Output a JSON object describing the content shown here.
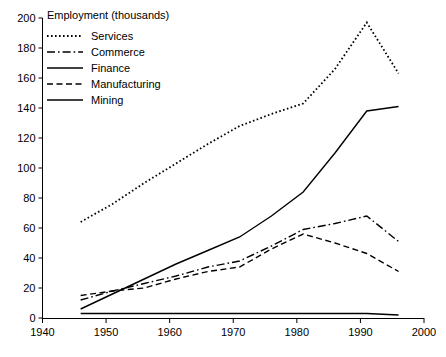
{
  "chart_data": {
    "type": "line",
    "title": "",
    "xlabel": "",
    "ylabel": "Employment (thousands)",
    "xlim": [
      1940,
      2000
    ],
    "ylim": [
      0,
      200
    ],
    "xticks": [
      1940,
      1950,
      1960,
      1970,
      1980,
      1990,
      2000
    ],
    "yticks": [
      0,
      20,
      40,
      60,
      80,
      100,
      120,
      140,
      160,
      180,
      200
    ],
    "grid": false,
    "legend_position": "top-left",
    "series": [
      {
        "name": "Services",
        "style": "dotted",
        "x": [
          1946,
          1951,
          1956,
          1961,
          1966,
          1971,
          1976,
          1981,
          1986,
          1991,
          1996
        ],
        "values": [
          64,
          76,
          90,
          103,
          116,
          128,
          136,
          143,
          166,
          197,
          163
        ]
      },
      {
        "name": "Commerce",
        "style": "dash-dot",
        "x": [
          1946,
          1951,
          1956,
          1961,
          1966,
          1971,
          1976,
          1981,
          1986,
          1991,
          1996
        ],
        "values": [
          12,
          18,
          23,
          28,
          34,
          38,
          48,
          59,
          63,
          68,
          51
        ]
      },
      {
        "name": "Finance",
        "style": "solid",
        "x": [
          1946,
          1951,
          1956,
          1961,
          1966,
          1971,
          1976,
          1981,
          1986,
          1991,
          1996
        ],
        "values": [
          6,
          16,
          26,
          36,
          45,
          54,
          68,
          84,
          110,
          138,
          141
        ]
      },
      {
        "name": "Manufacturing",
        "style": "dashed",
        "x": [
          1946,
          1951,
          1956,
          1961,
          1966,
          1971,
          1976,
          1981,
          1986,
          1991,
          1996
        ],
        "values": [
          15,
          18,
          20,
          26,
          31,
          34,
          46,
          56,
          50,
          43,
          31
        ]
      },
      {
        "name": "Mining",
        "style": "solid",
        "x": [
          1946,
          1951,
          1956,
          1961,
          1966,
          1971,
          1976,
          1981,
          1986,
          1991,
          1996
        ],
        "values": [
          3,
          3,
          3,
          3,
          3,
          3,
          3,
          3,
          3,
          3,
          2
        ]
      }
    ]
  },
  "axis": {
    "y_title": "Employment (thousands)",
    "y_tick_labels": [
      "200",
      "180",
      "160",
      "140",
      "120",
      "100",
      "80",
      "60",
      "40",
      "20",
      "0"
    ],
    "x_tick_labels": [
      "1940",
      "1950",
      "1960",
      "1970",
      "1980",
      "1990",
      "2000"
    ]
  },
  "legend": {
    "entries": [
      {
        "label": "Services"
      },
      {
        "label": "Commerce"
      },
      {
        "label": "Finance"
      },
      {
        "label": "Manufacturing"
      },
      {
        "label": "Mining"
      }
    ]
  },
  "colors": {
    "ink": "#000000",
    "background": "#ffffff"
  }
}
